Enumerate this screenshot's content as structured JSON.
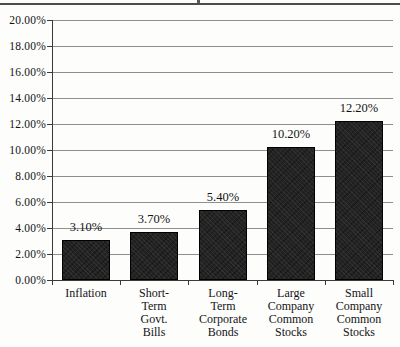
{
  "chart_data": {
    "type": "bar",
    "title": "",
    "categories": [
      "Inflation",
      "Short-Term Govt. Bills",
      "Long-Term Corporate Bonds",
      "Large Company Common Stocks",
      "Small Company Common Stocks"
    ],
    "category_label_lines": [
      [
        "Inflation"
      ],
      [
        "Short-",
        "Term",
        "Govt.",
        "Bills"
      ],
      [
        "Long-",
        "Term",
        "Corporate",
        "Bonds"
      ],
      [
        "Large",
        "Company",
        "Common",
        "Stocks"
      ],
      [
        "Small",
        "Company",
        "Common",
        "Stocks"
      ]
    ],
    "values": [
      3.1,
      3.7,
      5.4,
      10.2,
      12.2
    ],
    "value_labels": [
      "3.10%",
      "3.70%",
      "5.40%",
      "10.20%",
      "12.20%"
    ],
    "y_axis": {
      "min": 0,
      "max": 20,
      "step": 2,
      "tick_labels": [
        "0.00%",
        "2.00%",
        "4.00%",
        "6.00%",
        "8.00%",
        "10.00%",
        "12.00%",
        "14.00%",
        "16.00%",
        "18.00%",
        "20.00%"
      ]
    },
    "grid": true,
    "legend": false,
    "colors": {
      "bar_fill": "#232323",
      "bar_border": "#000000",
      "gridline": "#8f8f8f",
      "axis": "#3a3a3a",
      "text": "#141414"
    }
  }
}
